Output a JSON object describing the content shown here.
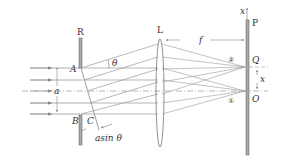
{
  "diagram": {
    "labels": {
      "slit_screen": "R",
      "lens": "L",
      "screen": "P",
      "point_a": "A",
      "point_b": "B",
      "point_c": "C",
      "slit_width": "a",
      "angle": "θ",
      "path_difference": "asin θ",
      "focal_length": "f",
      "point_q": "Q",
      "point_o": "O",
      "x_axis": "x",
      "displacement": "x",
      "ray_bundle_1": "①",
      "ray_bundle_2": "②"
    },
    "colors": {
      "line": "#888888",
      "dark": "#555555",
      "text": "#333333"
    }
  }
}
